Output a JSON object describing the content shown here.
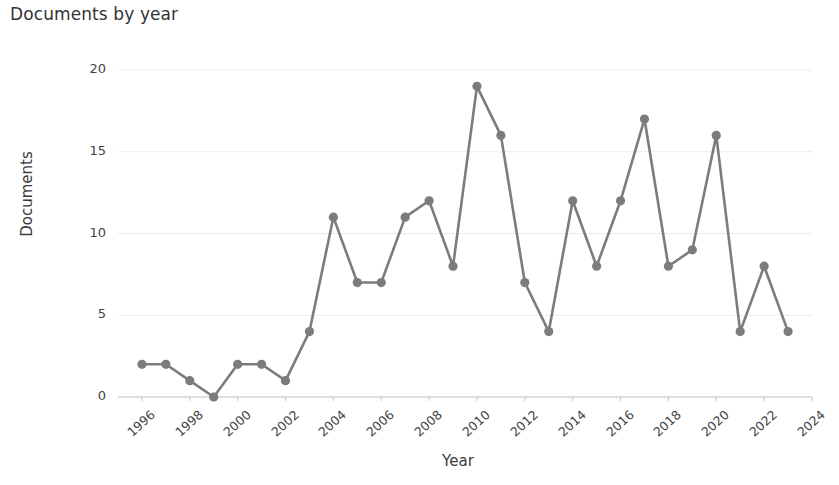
{
  "chart_data": {
    "type": "line",
    "title": "Documents by year",
    "xlabel": "Year",
    "ylabel": "Documents",
    "x": [
      1996,
      1997,
      1998,
      1999,
      2000,
      2001,
      2002,
      2003,
      2004,
      2005,
      2006,
      2007,
      2008,
      2009,
      2010,
      2011,
      2012,
      2013,
      2014,
      2015,
      2016,
      2017,
      2018,
      2019,
      2020,
      2021,
      2022,
      2023
    ],
    "values": [
      2,
      2,
      1,
      0,
      2,
      2,
      1,
      4,
      11,
      7,
      7,
      11,
      12,
      8,
      19,
      16,
      7,
      4,
      12,
      8,
      12,
      17,
      8,
      9,
      16,
      4,
      8,
      4
    ],
    "series": [
      {
        "name": "Documents",
        "values": [
          2,
          2,
          1,
          0,
          2,
          2,
          1,
          4,
          11,
          7,
          7,
          11,
          12,
          8,
          19,
          16,
          7,
          4,
          12,
          8,
          12,
          17,
          8,
          9,
          16,
          4,
          8,
          4
        ]
      }
    ],
    "xlim": [
      1995,
      2024
    ],
    "ylim": [
      0,
      20
    ],
    "yticks": [
      0,
      5,
      10,
      15,
      20
    ],
    "ytick_labels": [
      "0",
      "5",
      "10",
      "15",
      "20"
    ],
    "xticks": [
      1996,
      1998,
      2000,
      2002,
      2004,
      2006,
      2008,
      2010,
      2012,
      2014,
      2016,
      2018,
      2020,
      2022,
      2024
    ],
    "xtick_labels": [
      "1996",
      "1998",
      "2000",
      "2002",
      "2004",
      "2006",
      "2008",
      "2010",
      "2012",
      "2014",
      "2016",
      "2018",
      "2020",
      "2022",
      "2024"
    ],
    "grid": true,
    "grid_axis": "y",
    "legend": false,
    "legend_position": "none",
    "line_color": "#7c7c7c",
    "marker_color": "#7c7c7c",
    "marker": "circle",
    "grid_color": "#eceaf0",
    "axis_color": "#c9c7cf",
    "title_color": "#333333",
    "tick_color": "#444444"
  }
}
